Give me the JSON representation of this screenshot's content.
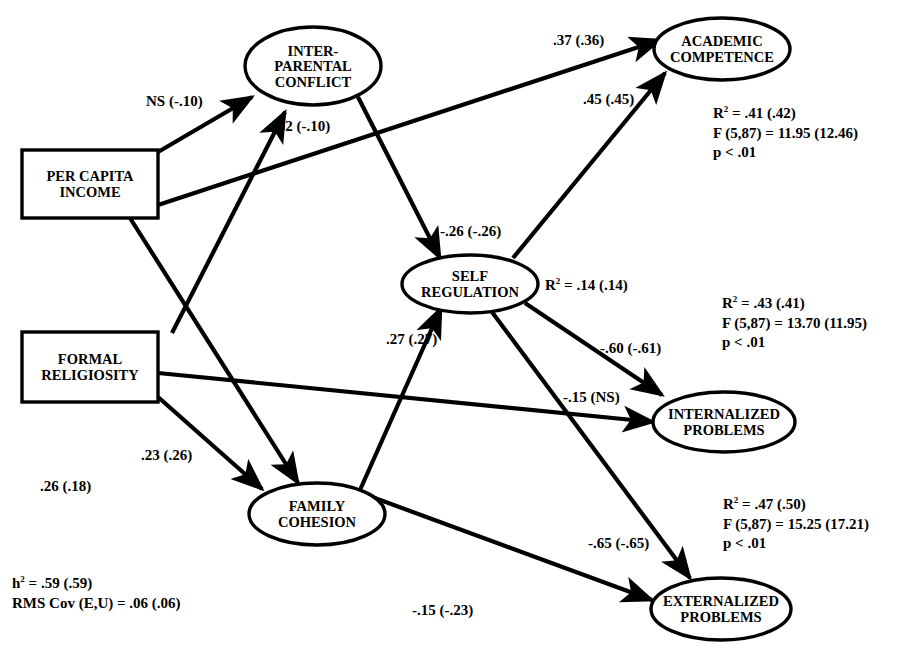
{
  "figure": {
    "type": "path-diagram",
    "background": "#ffffff",
    "stroke_color": "#000000",
    "width": 917,
    "height": 664
  },
  "nodes": [
    {
      "id": "per_capita_income",
      "shape": "rect",
      "lines": [
        "PER CAPITA",
        "INCOME"
      ],
      "cx": 90,
      "cy": 184,
      "rx": 68,
      "ry": 34
    },
    {
      "id": "formal_religiosity",
      "shape": "rect",
      "lines": [
        "FORMAL",
        "RELIGIOSITY"
      ],
      "cx": 90,
      "cy": 367,
      "rx": 68,
      "ry": 35
    },
    {
      "id": "interparental_conflict",
      "shape": "ellipse",
      "lines": [
        "INTER-",
        "PARENTAL",
        "CONFLICT"
      ],
      "cx": 313,
      "cy": 66,
      "rx": 68,
      "ry": 39
    },
    {
      "id": "self_regulation",
      "shape": "ellipse",
      "lines": [
        "SELF",
        "REGULATION"
      ],
      "cx": 470,
      "cy": 284,
      "rx": 68,
      "ry": 29
    },
    {
      "id": "family_cohesion",
      "shape": "ellipse",
      "lines": [
        "FAMILY",
        "COHESION"
      ],
      "cx": 317,
      "cy": 514,
      "rx": 68,
      "ry": 31
    },
    {
      "id": "academic_competence",
      "shape": "ellipse",
      "lines": [
        "ACADEMIC",
        "COMPETENCE"
      ],
      "cx": 722,
      "cy": 49,
      "rx": 68,
      "ry": 31
    },
    {
      "id": "internalized_problems",
      "shape": "ellipse",
      "lines": [
        "INTERNALIZED",
        "PROBLEMS"
      ],
      "cx": 724,
      "cy": 422,
      "rx": 71,
      "ry": 30
    },
    {
      "id": "externalized_problems",
      "shape": "ellipse",
      "lines": [
        "EXTERNALIZED",
        "PROBLEMS"
      ],
      "cx": 721,
      "cy": 609,
      "rx": 70,
      "ry": 31
    }
  ],
  "edges": [
    {
      "id": "pci_to_ipc",
      "from": "per_capita_income",
      "to": "interparental_conflict",
      "x1": 158,
      "y1": 152,
      "x2": 252,
      "y2": 97,
      "label": "NS (-.10)",
      "lx": 146,
      "ly": 94
    },
    {
      "id": "fr_to_ipc",
      "from": "formal_religiosity",
      "to": "interparental_conflict",
      "x1": 172,
      "y1": 333,
      "x2": 285,
      "y2": 112,
      "label": "-.32  (-.10)",
      "lx": 269,
      "ly": 119
    },
    {
      "id": "pci_to_ac",
      "from": "per_capita_income",
      "to": "academic_competence",
      "x1": 158,
      "y1": 205,
      "x2": 660,
      "y2": 40,
      "label": ".37  (.36)",
      "lx": 553,
      "ly": 33
    },
    {
      "id": "ipc_to_sr",
      "from": "interparental_conflict",
      "to": "self_regulation",
      "x1": 358,
      "y1": 97,
      "x2": 440,
      "y2": 258,
      "label": "-.26  (-.26)",
      "lx": 440,
      "ly": 224
    },
    {
      "id": "sr_to_ac",
      "from": "self_regulation",
      "to": "academic_competence",
      "x1": 513,
      "y1": 258,
      "x2": 665,
      "y2": 73,
      "label": ".45  (.45)",
      "lx": 583,
      "ly": 92
    },
    {
      "id": "sr_to_int",
      "from": "self_regulation",
      "to": "internalized_problems",
      "x1": 525,
      "y1": 303,
      "x2": 662,
      "y2": 395,
      "label": "-.60  (-.61)",
      "lx": 600,
      "ly": 341
    },
    {
      "id": "sr_to_ext",
      "from": "self_regulation",
      "to": "externalized_problems",
      "x1": 492,
      "y1": 312,
      "x2": 690,
      "y2": 578,
      "label": "-.65  (-.65)",
      "lx": 588,
      "ly": 536
    },
    {
      "id": "fc_to_sr",
      "from": "family_cohesion",
      "to": "self_regulation",
      "x1": 360,
      "y1": 490,
      "x2": 441,
      "y2": 308,
      "label": ".27  (.27)",
      "lx": 386,
      "ly": 332
    },
    {
      "id": "fr_to_int",
      "from": "formal_religiosity",
      "to": "internalized_problems",
      "x1": 158,
      "y1": 373,
      "x2": 653,
      "y2": 422,
      "label": "-.15 (NS)",
      "lx": 563,
      "ly": 390
    },
    {
      "id": "fr_to_fc",
      "from": "formal_religiosity",
      "to": "family_cohesion",
      "x1": 158,
      "y1": 397,
      "x2": 262,
      "y2": 489,
      "label": ".26  (.18)",
      "lx": 40,
      "ly": 479
    },
    {
      "id": "pci_to_fc",
      "from": "per_capita_income",
      "to": "family_cohesion",
      "x1": 130,
      "y1": 218,
      "x2": 298,
      "y2": 483,
      "label": ".23  (.26)",
      "lx": 141,
      "ly": 448
    },
    {
      "id": "fc_to_ext",
      "from": "family_cohesion",
      "to": "externalized_problems",
      "x1": 372,
      "y1": 497,
      "x2": 652,
      "y2": 600,
      "label": "-.15  (-.23)",
      "lx": 412,
      "ly": 603
    }
  ],
  "annotations": {
    "self_regulation_r2": {
      "text_prefix": "R",
      "sup": "2",
      "text_suffix": " = .14  (.14)",
      "x": 545,
      "y": 276
    }
  },
  "stats_blocks": [
    {
      "id": "academic_competence_stats",
      "for": "academic_competence",
      "x": 713,
      "y": 104,
      "r2_prefix": "R",
      "r2_sup": "2",
      "r2_value": " = .41  (.42)",
      "f_line": "F (5,87) = 11.95  (12.46)",
      "p_line": "p < .01"
    },
    {
      "id": "internalized_problems_stats",
      "for": "internalized_problems",
      "x": 722,
      "y": 294,
      "r2_prefix": "R",
      "r2_sup": "2",
      "r2_value": " = .43  (.41)",
      "f_line": "F (5,87) =  13.70  (11.95)",
      "p_line": "p < .01"
    },
    {
      "id": "externalized_problems_stats",
      "for": "externalized_problems",
      "x": 723,
      "y": 495,
      "r2_prefix": "R",
      "r2_sup": "2",
      "r2_value": " = .47  (.50)",
      "f_line": "F (5,87) = 15.25  (17.21)",
      "p_line": "p < .01"
    }
  ],
  "fit_indices": {
    "x": 12,
    "y": 574,
    "h2_prefix": "h",
    "h2_sup": "2",
    "h2_value": " = .59  (.59)",
    "rms_line": "RMS Cov (E,U)  = .06  (.06)"
  }
}
